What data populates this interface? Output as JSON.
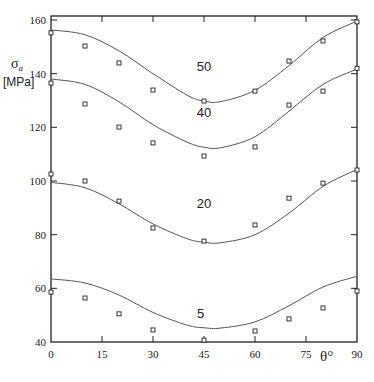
{
  "chart_data": {
    "type": "scatter",
    "title": "",
    "xlabel": "θ°",
    "ylabel_symbol": "σ",
    "ylabel_subscript": "a",
    "ylabel_unit": "[MPa]",
    "xlim": [
      0,
      90
    ],
    "ylim": [
      40,
      160
    ],
    "x_ticks": [
      0,
      15,
      30,
      45,
      60,
      75,
      90
    ],
    "x_tick_labels": [
      "0",
      "15",
      "30",
      "45",
      "60",
      "75",
      "90"
    ],
    "y_ticks": [
      40,
      60,
      80,
      100,
      120,
      140,
      160
    ],
    "y_tick_labels": [
      "40",
      "60",
      "80",
      "100",
      "120",
      "140",
      "160"
    ],
    "grid": false,
    "legend": "none",
    "marker": "open-square",
    "series": [
      {
        "name": "50",
        "label": "50",
        "label_at": [
          45,
          141
        ],
        "points": {
          "x": [
            0,
            10,
            20,
            30,
            45,
            60,
            70,
            80,
            90
          ],
          "y": [
            155.2,
            150.3,
            144.0,
            133.9,
            129.8,
            133.5,
            144.7,
            152.2,
            159.3
          ]
        },
        "fit_curve": {
          "x": [
            0,
            10,
            20,
            30,
            40,
            45,
            50,
            60,
            70,
            80,
            90
          ],
          "y": [
            156.3,
            154.5,
            148.5,
            140.0,
            132.0,
            129.8,
            129.6,
            133.8,
            143.0,
            153.5,
            159.6
          ]
        }
      },
      {
        "name": "40",
        "label": "40",
        "label_at": [
          45,
          124
        ],
        "points": {
          "x": [
            0,
            10,
            20,
            30,
            45,
            60,
            70,
            80,
            90
          ],
          "y": [
            136.5,
            128.7,
            120.1,
            114.2,
            109.3,
            112.7,
            128.3,
            133.5,
            142.0
          ]
        },
        "fit_curve": {
          "x": [
            0,
            10,
            20,
            30,
            40,
            45,
            50,
            60,
            70,
            80,
            90
          ],
          "y": [
            138.0,
            136.0,
            129.5,
            121.0,
            114.5,
            112.6,
            112.4,
            116.5,
            126.0,
            136.0,
            141.7
          ]
        }
      },
      {
        "name": "20",
        "label": "20",
        "label_at": [
          45,
          90
        ],
        "points": {
          "x": [
            0,
            10,
            20,
            30,
            45,
            60,
            70,
            80,
            90
          ],
          "y": [
            102.6,
            100.0,
            92.5,
            82.5,
            77.6,
            83.6,
            93.6,
            99.2,
            104.1
          ]
        },
        "fit_curve": {
          "x": [
            0,
            10,
            20,
            30,
            40,
            45,
            50,
            60,
            70,
            80,
            90
          ],
          "y": [
            99.5,
            97.5,
            91.5,
            84.0,
            78.5,
            77.2,
            77.0,
            80.0,
            88.0,
            98.0,
            104.3
          ]
        }
      },
      {
        "name": "5",
        "label": "5",
        "label_at": [
          44,
          49
        ],
        "points": {
          "x": [
            0,
            10,
            20,
            30,
            45,
            60,
            70,
            80,
            90
          ],
          "y": [
            58.6,
            56.4,
            50.5,
            44.5,
            40.7,
            44.1,
            48.6,
            52.7,
            59.0
          ]
        },
        "fit_curve": {
          "x": [
            0,
            10,
            20,
            30,
            40,
            45,
            50,
            60,
            70,
            80,
            90
          ],
          "y": [
            63.5,
            62.0,
            57.5,
            51.0,
            46.3,
            45.3,
            45.2,
            47.5,
            53.5,
            60.5,
            64.5
          ]
        }
      }
    ]
  }
}
